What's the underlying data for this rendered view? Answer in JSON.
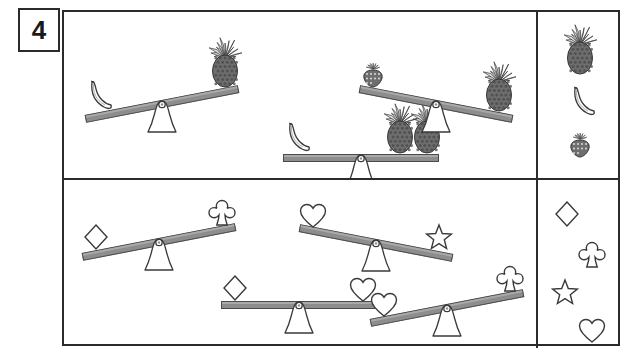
{
  "worksheet": {
    "problem_number": "4",
    "type": "balance-scale-comparison",
    "colors": {
      "frame_stroke": "#2b2b2b",
      "beam_fill": "#8d8d8d",
      "beam_stroke": "#4a4a4a",
      "shape_stroke": "#3a3a3a",
      "fruit_fill": "#6e6e6e",
      "background": "#ffffff"
    }
  },
  "panels": [
    {
      "id": "fruit-panel",
      "name": "top-panel-fruits",
      "legend": {
        "name": "fruit-legend",
        "items": [
          {
            "icon": "pineapple-icon",
            "label": "pineapple",
            "x": 40,
            "y": 38,
            "scale": 1.0
          },
          {
            "icon": "banana-icon",
            "label": "banana",
            "x": 42,
            "y": 90,
            "scale": 1.0
          },
          {
            "icon": "strawberry-icon",
            "label": "strawberry",
            "x": 40,
            "y": 134,
            "scale": 1.0
          }
        ]
      },
      "scales": [
        {
          "name": "scale-banana-vs-pineapple",
          "x": 98,
          "y": 92,
          "tilt": -11,
          "left": {
            "icon": "banana-icon",
            "label": "banana",
            "count": 1
          },
          "right": {
            "icon": "pineapple-icon",
            "label": "pineapple",
            "count": 1
          },
          "heavier": "left"
        },
        {
          "name": "scale-banana-equals-two-pineapples",
          "x": 297,
          "y": 146,
          "tilt": 0,
          "left": {
            "icon": "banana-icon",
            "label": "banana",
            "count": 1
          },
          "right": {
            "icon": "pineapple-icon",
            "label": "pineapple",
            "count": 2
          },
          "heavier": "balanced"
        },
        {
          "name": "scale-strawberry-vs-pineapple",
          "x": 372,
          "y": 92,
          "tilt": 11,
          "left": {
            "icon": "strawberry-icon",
            "label": "strawberry",
            "count": 1
          },
          "right": {
            "icon": "pineapple-icon",
            "label": "pineapple",
            "count": 1
          },
          "heavier": "right"
        }
      ]
    },
    {
      "id": "shape-panel",
      "name": "bottom-panel-shapes",
      "legend": {
        "name": "shape-legend",
        "items": [
          {
            "icon": "diamond-icon",
            "label": "diamond",
            "x": 27,
            "y": 34,
            "scale": 1.0
          },
          {
            "icon": "club-icon",
            "label": "club",
            "x": 52,
            "y": 75,
            "scale": 1.0
          },
          {
            "icon": "star-icon",
            "label": "star",
            "x": 25,
            "y": 113,
            "scale": 1.0
          },
          {
            "icon": "heart-icon",
            "label": "heart",
            "x": 52,
            "y": 150,
            "scale": 1.0
          }
        ]
      },
      "scales": [
        {
          "name": "scale-diamond-vs-club",
          "x": 95,
          "y": 62,
          "tilt": -11,
          "left": {
            "icon": "diamond-icon",
            "label": "diamond",
            "count": 1
          },
          "right": {
            "icon": "club-icon",
            "label": "club",
            "count": 1
          },
          "heavier": "left"
        },
        {
          "name": "scale-heart-vs-star",
          "x": 312,
          "y": 63,
          "tilt": 11,
          "left": {
            "icon": "heart-icon",
            "label": "heart",
            "count": 1
          },
          "right": {
            "icon": "star-icon",
            "label": "star",
            "count": 1
          },
          "heavier": "right"
        },
        {
          "name": "scale-diamond-equals-heart",
          "x": 235,
          "y": 125,
          "tilt": 0,
          "left": {
            "icon": "diamond-icon",
            "label": "diamond",
            "count": 1
          },
          "right": {
            "icon": "heart-icon",
            "label": "heart",
            "count": 1
          },
          "heavier": "balanced"
        },
        {
          "name": "scale-heart-vs-club",
          "x": 383,
          "y": 128,
          "tilt": -11,
          "left": {
            "icon": "heart-icon",
            "label": "heart",
            "count": 1
          },
          "right": {
            "icon": "club-icon",
            "label": "club",
            "count": 1
          },
          "heavier": "left"
        }
      ]
    }
  ]
}
